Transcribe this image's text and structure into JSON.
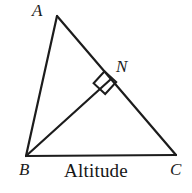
{
  "figure": {
    "kind": "geometry-diagram",
    "title": "Altitude",
    "background_color": "#ffffff",
    "stroke_color": "#1c1c1c",
    "stroke_width": 2,
    "canvas": {
      "width": 192,
      "height": 193
    },
    "caption": {
      "text": "Altitude"
    },
    "points": {
      "A": {
        "label": "A",
        "x": 57,
        "y": 16
      },
      "B": {
        "label": "B",
        "x": 26,
        "y": 156
      },
      "C": {
        "label": "C",
        "x": 176,
        "y": 155
      },
      "N": {
        "label": "N",
        "x": 111,
        "y": 79
      }
    },
    "segments": [
      {
        "name": "side-AB",
        "from": "A",
        "to": "B"
      },
      {
        "name": "side-AC",
        "from": "A",
        "to": "C"
      },
      {
        "name": "side-BC",
        "from": "B",
        "to": "C"
      },
      {
        "name": "altitude-BN",
        "from": "B",
        "to": "N"
      }
    ],
    "right_angle": {
      "at": "N",
      "label": "right-angle-mark",
      "size": 15,
      "path": "M 104.6 71.3 L 93.6 83.3 L 105.2 94.0 L 116.2 82.0 Z"
    },
    "labels": {
      "A": "A",
      "B": "B",
      "C": "C",
      "N": "N"
    }
  }
}
